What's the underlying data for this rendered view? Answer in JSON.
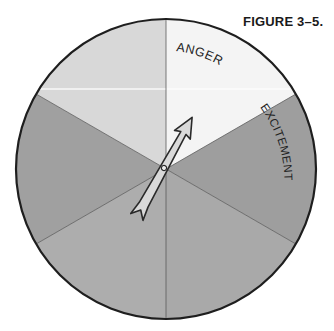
{
  "figure": {
    "label": "FIGURE 3–5."
  },
  "spinner": {
    "center": [
      166,
      169
    ],
    "radius": 150,
    "sectors": [
      {
        "label": "ANGER",
        "start_deg": 30,
        "end_deg": 90,
        "color": "#f4f4f4"
      },
      {
        "label": "EXCITEMENT",
        "start_deg": -30,
        "end_deg": 30,
        "color": "#9e9e9e"
      },
      {
        "label": "",
        "start_deg": -90,
        "end_deg": -30,
        "color": "#a8a8a8"
      },
      {
        "label": "",
        "start_deg": -150,
        "end_deg": -90,
        "color": "#ababab"
      },
      {
        "label": "",
        "start_deg": 150,
        "end_deg": 210,
        "color": "#9f9f9f"
      },
      {
        "label": "",
        "start_deg": 90,
        "end_deg": 150,
        "color": "#d6d6d6"
      }
    ],
    "pointer": {
      "description": "arrow spinner pointing toward upper-right (ANGER/EXCITEMENT boundary)",
      "angle_deg": 61
    }
  },
  "colors": {
    "outline": "#1e1e1e",
    "divider": "#555555",
    "arrow_fill": "#d9d9d9",
    "arrow_stroke": "#2a2a2a"
  }
}
